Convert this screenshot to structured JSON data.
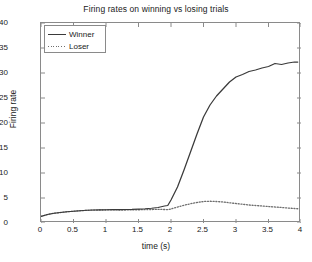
{
  "figure": {
    "title": "Firing rates on winning vs losing trials",
    "xlabel": "time (s)",
    "ylabel": "Firing rate"
  },
  "legend": {
    "items": [
      {
        "label": "Winner",
        "style": "solid"
      },
      {
        "label": "Loser",
        "style": "dotted"
      }
    ]
  },
  "axes": {
    "xticks": [
      "0",
      "0.5",
      "1",
      "1.5",
      "2",
      "2.5",
      "3",
      "3.5",
      "4"
    ],
    "yticks": [
      "0",
      "5",
      "10",
      "15",
      "20",
      "25",
      "30",
      "35",
      "40"
    ]
  },
  "colors": {
    "winner_line": "#3a3a3a",
    "loser_line": "#6e6e6e",
    "axis": "#8a8a8a",
    "background": "#ffffff",
    "text": "#1a1a1a"
  },
  "chart_data": {
    "type": "line",
    "title": "Firing rates on winning vs losing trials",
    "xlabel": "time (s)",
    "ylabel": "Firing rate",
    "xlim": [
      0,
      4
    ],
    "ylim": [
      0,
      40
    ],
    "xticks": [
      0,
      0.5,
      1,
      1.5,
      2,
      2.5,
      3,
      3.5,
      4
    ],
    "yticks": [
      0,
      5,
      10,
      15,
      20,
      25,
      30,
      35,
      40
    ],
    "grid": false,
    "legend_position": "upper left",
    "x": [
      0,
      0.1,
      0.2,
      0.3,
      0.4,
      0.5,
      0.6,
      0.7,
      0.8,
      0.9,
      1.0,
      1.1,
      1.2,
      1.3,
      1.4,
      1.5,
      1.6,
      1.7,
      1.8,
      1.9,
      1.95,
      2.0,
      2.1,
      2.2,
      2.3,
      2.4,
      2.5,
      2.6,
      2.7,
      2.8,
      2.9,
      3.0,
      3.1,
      3.2,
      3.3,
      3.4,
      3.5,
      3.6,
      3.7,
      3.8,
      3.9,
      3.95
    ],
    "series": [
      {
        "name": "Winner",
        "style": "solid",
        "color": "#3a3a3a",
        "values": [
          1.3,
          1.7,
          1.95,
          2.1,
          2.25,
          2.35,
          2.45,
          2.55,
          2.6,
          2.62,
          2.65,
          2.7,
          2.68,
          2.7,
          2.72,
          2.78,
          2.85,
          2.95,
          3.1,
          3.4,
          3.5,
          4.6,
          7.2,
          10.6,
          14.2,
          17.8,
          21.2,
          23.6,
          25.4,
          26.8,
          28.2,
          29.2,
          29.7,
          30.3,
          30.6,
          31.0,
          31.3,
          31.9,
          31.7,
          32.0,
          32.2,
          32.2
        ]
      },
      {
        "name": "Loser",
        "style": "dotted",
        "color": "#6e6e6e",
        "values": [
          1.3,
          1.7,
          1.95,
          2.1,
          2.25,
          2.35,
          2.45,
          2.52,
          2.58,
          2.6,
          2.6,
          2.62,
          2.6,
          2.6,
          2.62,
          2.65,
          2.68,
          2.7,
          2.72,
          2.7,
          2.68,
          2.8,
          3.2,
          3.55,
          3.85,
          4.1,
          4.3,
          4.35,
          4.3,
          4.2,
          4.05,
          3.9,
          3.75,
          3.6,
          3.5,
          3.4,
          3.3,
          3.2,
          3.1,
          3.0,
          2.9,
          2.85
        ]
      }
    ]
  }
}
